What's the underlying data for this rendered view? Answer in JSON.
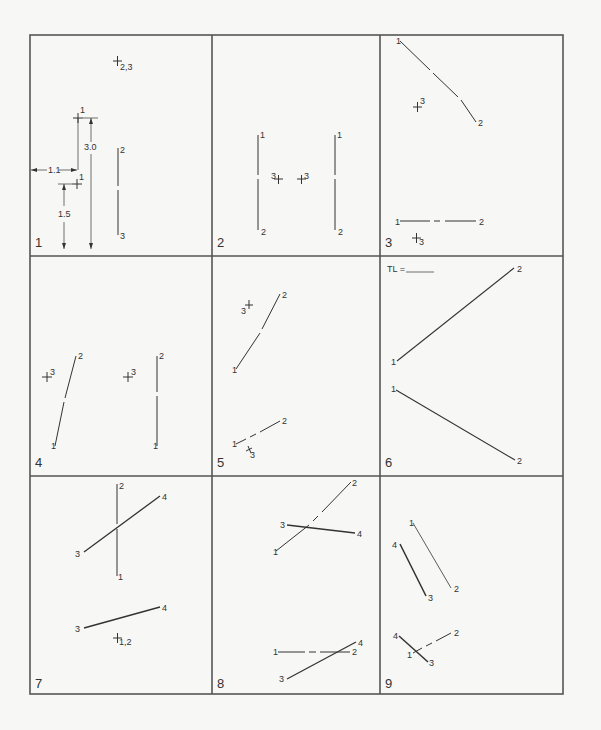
{
  "worksheet": {
    "grid": {
      "cols": 3,
      "rows": 3
    },
    "line_color": "#333333",
    "border_color": "#555555",
    "background": "#f7f7f5"
  },
  "problems": [
    {
      "number": "1",
      "labels": [
        {
          "text": "1",
          "x": 80,
          "y": 113
        },
        {
          "text": "2,3",
          "x": 120,
          "y": 67
        },
        {
          "text": "1",
          "x": 79,
          "y": 183
        },
        {
          "text": "2",
          "x": 118,
          "y": 153
        },
        {
          "text": "3",
          "x": 118,
          "y": 237
        },
        {
          "text": "3.0",
          "x": 86,
          "y": 147
        },
        {
          "text": "1.1",
          "x": 49,
          "y": 174
        },
        {
          "text": "1.5",
          "x": 60,
          "y": 215
        }
      ]
    },
    {
      "number": "2",
      "labels": [
        {
          "text": "1",
          "x": 261,
          "y": 138
        },
        {
          "text": "2",
          "x": 261,
          "y": 233
        },
        {
          "text": "3",
          "x": 272,
          "y": 180
        },
        {
          "text": "3",
          "x": 304,
          "y": 180
        },
        {
          "text": "1",
          "x": 338,
          "y": 138
        },
        {
          "text": "2",
          "x": 338,
          "y": 233
        }
      ]
    },
    {
      "number": "3",
      "labels": [
        {
          "text": "1",
          "x": 396,
          "y": 43
        },
        {
          "text": "2",
          "x": 478,
          "y": 125
        },
        {
          "text": "3",
          "x": 418,
          "y": 104
        },
        {
          "text": "1",
          "x": 396,
          "y": 224
        },
        {
          "text": "2",
          "x": 479,
          "y": 225
        },
        {
          "text": "3",
          "x": 417,
          "y": 245
        }
      ]
    },
    {
      "number": "4",
      "labels": [
        {
          "text": "2",
          "x": 80,
          "y": 358
        },
        {
          "text": "3",
          "x": 49,
          "y": 374
        },
        {
          "text": "1",
          "x": 51,
          "y": 450
        },
        {
          "text": "3",
          "x": 130,
          "y": 374
        },
        {
          "text": "2",
          "x": 159,
          "y": 358
        },
        {
          "text": "1",
          "x": 154,
          "y": 450
        }
      ]
    },
    {
      "number": "5",
      "labels": [
        {
          "text": "2",
          "x": 283,
          "y": 298
        },
        {
          "text": "3",
          "x": 241,
          "y": 312
        },
        {
          "text": "1",
          "x": 232,
          "y": 373
        },
        {
          "text": "2",
          "x": 283,
          "y": 424
        },
        {
          "text": "1",
          "x": 232,
          "y": 446
        },
        {
          "text": "3",
          "x": 250,
          "y": 458
        }
      ]
    },
    {
      "number": "6",
      "title_label": "TL =",
      "labels": [
        {
          "text": "2",
          "x": 518,
          "y": 272
        },
        {
          "text": "1",
          "x": 391,
          "y": 366
        },
        {
          "text": "1",
          "x": 391,
          "y": 393
        },
        {
          "text": "2",
          "x": 518,
          "y": 463
        }
      ]
    },
    {
      "number": "7",
      "labels": [
        {
          "text": "2",
          "x": 120,
          "y": 489
        },
        {
          "text": "4",
          "x": 164,
          "y": 499
        },
        {
          "text": "3",
          "x": 76,
          "y": 556
        },
        {
          "text": "1",
          "x": 119,
          "y": 579
        },
        {
          "text": "4",
          "x": 164,
          "y": 610
        },
        {
          "text": "3",
          "x": 76,
          "y": 632
        },
        {
          "text": "1,2",
          "x": 119,
          "y": 646
        }
      ]
    },
    {
      "number": "8",
      "labels": [
        {
          "text": "2",
          "x": 353,
          "y": 485
        },
        {
          "text": "3",
          "x": 280,
          "y": 529
        },
        {
          "text": "4",
          "x": 357,
          "y": 537
        },
        {
          "text": "1",
          "x": 273,
          "y": 553
        },
        {
          "text": "4",
          "x": 358,
          "y": 646
        },
        {
          "text": "1",
          "x": 273,
          "y": 656
        },
        {
          "text": "2",
          "x": 352,
          "y": 656
        },
        {
          "text": "3",
          "x": 280,
          "y": 682
        }
      ]
    },
    {
      "number": "9",
      "labels": [
        {
          "text": "1",
          "x": 410,
          "y": 527
        },
        {
          "text": "4",
          "x": 393,
          "y": 547
        },
        {
          "text": "2",
          "x": 454,
          "y": 592
        },
        {
          "text": "3",
          "x": 428,
          "y": 601
        },
        {
          "text": "2",
          "x": 454,
          "y": 636
        },
        {
          "text": "4",
          "x": 393,
          "y": 639
        },
        {
          "text": "1",
          "x": 408,
          "y": 658
        },
        {
          "text": "3",
          "x": 429,
          "y": 665
        }
      ]
    }
  ]
}
